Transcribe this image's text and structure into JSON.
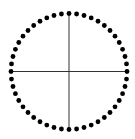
{
  "diagram": {
    "type": "dotted-circle-with-crosshair",
    "center": {
      "x": 69,
      "y": 71.5
    },
    "radius": 58,
    "dot_count": 48,
    "dot_radius": 2.4,
    "dot_color": "#000000",
    "line_color": "#333333",
    "line_width": 1,
    "background": "#ffffff"
  }
}
